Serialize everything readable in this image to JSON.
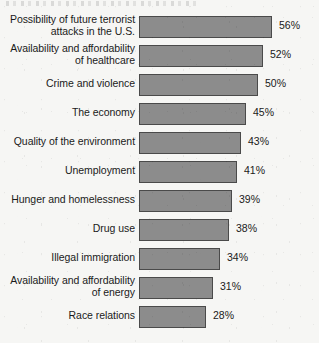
{
  "chart_data": {
    "type": "bar",
    "orientation": "horizontal",
    "title": "",
    "xlabel": "",
    "ylabel": "",
    "xlim": [
      0,
      60
    ],
    "grid": false,
    "legend": null,
    "value_suffix": "%",
    "categories": [
      "Possibility of future terrorist\nattacks in the U.S.",
      "Availability and affordability\nof healthcare",
      "Crime and violence",
      "The economy",
      "Quality of the environment",
      "Unemployment",
      "Hunger and homelessness",
      "Drug use",
      "Illegal immigration",
      "Availability and affordability\nof energy",
      "Race relations"
    ],
    "values": [
      56,
      52,
      50,
      45,
      43,
      41,
      39,
      38,
      34,
      31,
      28
    ],
    "value_labels": [
      "56%",
      "52%",
      "50%",
      "45%",
      "43%",
      "41%",
      "39%",
      "38%",
      "34%",
      "31%",
      "28%"
    ],
    "bars": [
      {
        "label": "Possibility of future terrorist\nattacks in the U.S.",
        "value": 56,
        "value_label": "56%",
        "lines": 2
      },
      {
        "label": "Availability and affordability\nof healthcare",
        "value": 52,
        "value_label": "52%",
        "lines": 2
      },
      {
        "label": "Crime and violence",
        "value": 50,
        "value_label": "50%",
        "lines": 1
      },
      {
        "label": "The economy",
        "value": 45,
        "value_label": "45%",
        "lines": 1
      },
      {
        "label": "Quality of the environment",
        "value": 43,
        "value_label": "43%",
        "lines": 1
      },
      {
        "label": "Unemployment",
        "value": 41,
        "value_label": "41%",
        "lines": 1
      },
      {
        "label": "Hunger and homelessness",
        "value": 39,
        "value_label": "39%",
        "lines": 1
      },
      {
        "label": "Drug use",
        "value": 38,
        "value_label": "38%",
        "lines": 1
      },
      {
        "label": "Illegal immigration",
        "value": 34,
        "value_label": "34%",
        "lines": 1
      },
      {
        "label": "Availability and affordability\nof energy",
        "value": 31,
        "value_label": "31%",
        "lines": 2
      },
      {
        "label": "Race relations",
        "value": 28,
        "value_label": "28%",
        "lines": 1
      }
    ],
    "colors": {
      "bar_fill": "#8c8c8c",
      "bar_border": "#4a4a4a",
      "background": "#f6f6f4",
      "text": "#1a1a1a"
    }
  }
}
